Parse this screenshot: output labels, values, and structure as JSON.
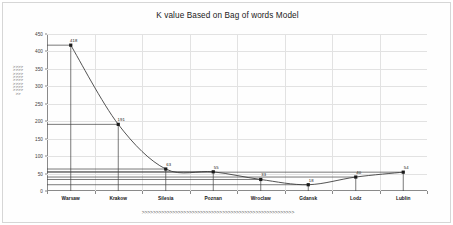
{
  "chart_data": {
    "type": "line",
    "title": "K value Based on Bag of words Model",
    "xlabel": ">>>>>>>>>>>>>>>>>>>>>>>>>>>>>>>>>>>>>>>>>>>>>>>>>>>>>>>",
    "ylabel": ">>>>>>>>>>>>>>>>>>>>>>>>>>>>>>>>>>",
    "categories": [
      "Warsaw",
      "Krakow",
      "Silesia",
      "Poznan",
      "Wroclaw",
      "Gdansk",
      "Lodz",
      "Lublin"
    ],
    "values": [
      418,
      191,
      63,
      55,
      33,
      18,
      40,
      54
    ],
    "point_labels": [
      "418",
      "191",
      "63",
      "55",
      "33",
      "18",
      "40",
      "54"
    ],
    "ylim": [
      0,
      450
    ],
    "yticks": [
      0,
      50,
      100,
      150,
      200,
      250,
      300,
      350,
      400,
      450
    ],
    "ytick_labels": [
      "0",
      "50",
      "100",
      "150",
      "200",
      "250",
      "300",
      "350",
      "400",
      "450"
    ],
    "grid": true,
    "legend": "none",
    "series_color": "#404040",
    "marker_color": "#1a1a1a",
    "grid_color": "#e2e2e2",
    "axis_color": "#8a8a8a",
    "error_bars": true
  }
}
